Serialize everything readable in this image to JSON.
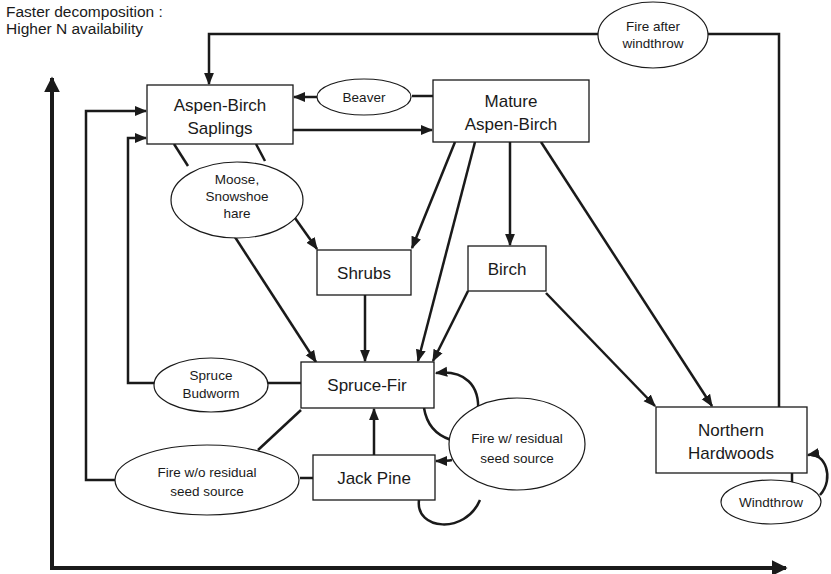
{
  "axis": {
    "label_line1": "Faster decomposition :",
    "label_line2": "Higher N availability"
  },
  "boxes": {
    "aspen_birch_saplings": {
      "line1": "Aspen-Birch",
      "line2": "Saplings"
    },
    "mature_aspen_birch": {
      "line1": "Mature",
      "line2": "Aspen-Birch"
    },
    "shrubs": {
      "line1": "Shrubs"
    },
    "birch": {
      "line1": "Birch"
    },
    "spruce_fir": {
      "line1": "Spruce-Fir"
    },
    "jack_pine": {
      "line1": "Jack Pine"
    },
    "northern_hardwoods": {
      "line1": "Northern",
      "line2": "Hardwoods"
    }
  },
  "disturbances": {
    "fire_after_windthrow": {
      "line1": "Fire after",
      "line2": "windthrow"
    },
    "beaver": {
      "line1": "Beaver"
    },
    "moose_hare": {
      "line1": "Moose,",
      "line2": "Snowshoe",
      "line3": "hare"
    },
    "spruce_budworm": {
      "line1": "Spruce",
      "line2": "Budworm"
    },
    "fire_wo_residual": {
      "line1": "Fire w/o residual",
      "line2": "seed source"
    },
    "fire_w_residual": {
      "line1": "Fire w/ residual",
      "line2": "seed source"
    },
    "windthrow": {
      "line1": "Windthrow"
    }
  },
  "colors": {
    "ink": "#1a1a1a",
    "background": "#ffffff"
  }
}
